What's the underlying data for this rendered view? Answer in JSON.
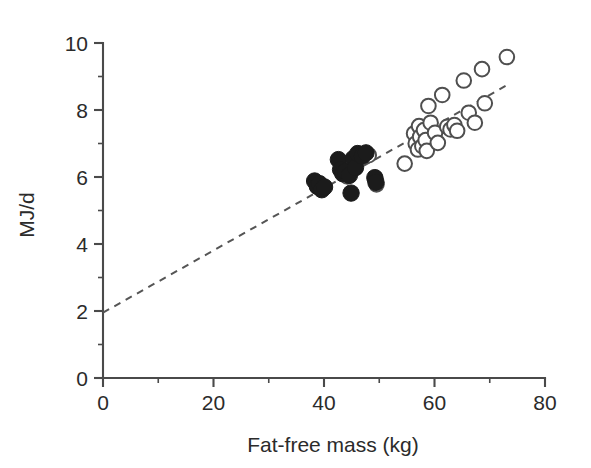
{
  "chart_data": {
    "type": "scatter",
    "title": "",
    "xlabel": "Fat-free mass (kg)",
    "ylabel": "MJ/d",
    "xlim": [
      0,
      80
    ],
    "ylim": [
      0,
      10
    ],
    "xticks": [
      0,
      20,
      40,
      60,
      80
    ],
    "yticks": [
      0,
      2,
      4,
      6,
      8,
      10
    ],
    "xtick_labels": [
      "0",
      "20",
      "40",
      "60",
      "80"
    ],
    "ytick_labels": [
      "0",
      "2",
      "4",
      "6",
      "8",
      "10"
    ],
    "x_minor_ticks": [
      10,
      30,
      50,
      70
    ],
    "y_minor_ticks": [
      1,
      3,
      5,
      7,
      9
    ],
    "grid": false,
    "legend": null,
    "legend_position": "none",
    "series": [
      {
        "name": "filled",
        "marker": "filled-circle",
        "color": "#1b1b1b",
        "points": [
          [
            38.3,
            5.88
          ],
          [
            38.8,
            5.72
          ],
          [
            39.2,
            5.8
          ],
          [
            39.6,
            5.62
          ],
          [
            40.1,
            5.7
          ],
          [
            42.6,
            6.52
          ],
          [
            43.0,
            6.22
          ],
          [
            43.4,
            6.1
          ],
          [
            43.9,
            6.16
          ],
          [
            44.6,
            6.05
          ],
          [
            44.9,
            5.52
          ],
          [
            45.3,
            6.55
          ],
          [
            45.7,
            6.28
          ],
          [
            46.1,
            6.7
          ],
          [
            46.9,
            6.62
          ],
          [
            47.6,
            6.72
          ],
          [
            49.2,
            5.98
          ],
          [
            49.4,
            5.84
          ]
        ]
      },
      {
        "name": "open",
        "marker": "open-circle",
        "color": "#4f4f4f",
        "points": [
          [
            43.6,
            6.18
          ],
          [
            44.2,
            6.02
          ],
          [
            48.1,
            6.65
          ],
          [
            49.3,
            5.95
          ],
          [
            49.5,
            5.78
          ],
          [
            54.6,
            6.4
          ],
          [
            56.3,
            7.3
          ],
          [
            56.6,
            7.0
          ],
          [
            57.0,
            6.82
          ],
          [
            57.2,
            7.52
          ],
          [
            57.4,
            7.2
          ],
          [
            57.8,
            6.92
          ],
          [
            58.1,
            7.4
          ],
          [
            58.4,
            7.1
          ],
          [
            58.6,
            6.78
          ],
          [
            58.9,
            8.12
          ],
          [
            59.3,
            7.62
          ],
          [
            60.1,
            7.32
          ],
          [
            60.6,
            7.02
          ],
          [
            61.4,
            8.45
          ],
          [
            62.3,
            7.5
          ],
          [
            62.9,
            7.42
          ],
          [
            63.6,
            7.55
          ],
          [
            64.1,
            7.38
          ],
          [
            65.3,
            8.88
          ],
          [
            66.2,
            7.92
          ],
          [
            67.3,
            7.62
          ],
          [
            68.6,
            9.22
          ],
          [
            69.1,
            8.2
          ],
          [
            73.1,
            9.58
          ]
        ]
      }
    ],
    "fit_line": {
      "type": "dashed-regression",
      "x_start": 0,
      "y_start": 1.95,
      "x_end": 73.2,
      "y_end": 8.75
    }
  }
}
